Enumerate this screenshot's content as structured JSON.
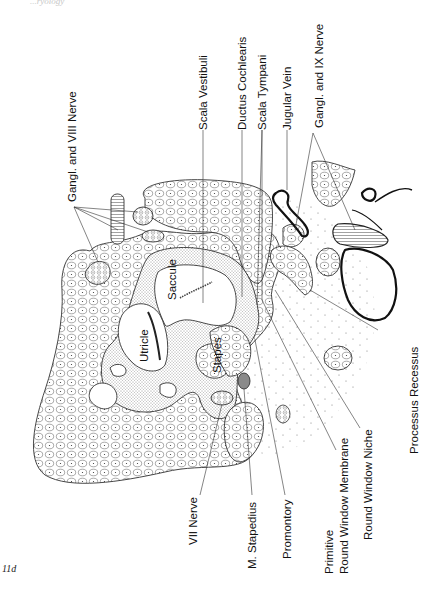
{
  "page": {
    "running_head": "...ryology",
    "figure_number": "11d"
  },
  "labels_top": {
    "gangl_viii": "Gangl. and VIII Nerve",
    "scala_vestibuli": "Scala Vestibuli",
    "ductus_cochlearis": "Ductus Cochlearis",
    "scala_tympani": "Scala Tympani",
    "jugular_vein": "Jugular Vein",
    "gangl_ix": "Gangl. and IX Nerve"
  },
  "labels_inner": {
    "saccule": "Saccule",
    "utricle": "Utricle",
    "stapes": "Stapes"
  },
  "labels_bottom": {
    "vii_nerve": "VII Nerve",
    "m_stapedius": "M. Stapedius",
    "promontory": "Promontory",
    "primitive": "Primitive",
    "round_window_membrane": "Round Window Membrane",
    "round_window_niche": "Round Window Niche",
    "processus_recessus": "Processus Recessus"
  },
  "colors": {
    "ink": "#1a1a1a",
    "paper": "#ffffff",
    "stapedius_fill": "#8a8a8a"
  }
}
